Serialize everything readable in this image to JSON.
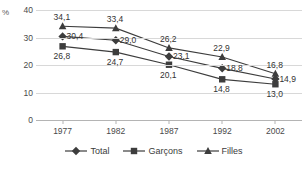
{
  "chart_data": {
    "type": "line",
    "title": "",
    "xlabel": "",
    "ylabel": "%",
    "unit_label": "%",
    "categories": [
      "1977",
      "1982",
      "1987",
      "1992",
      "2002"
    ],
    "ylim": [
      0,
      40
    ],
    "yticks": [
      "0",
      "10",
      "20",
      "30",
      "40"
    ],
    "ytick_values": [
      0,
      10,
      20,
      30,
      40
    ],
    "grid": true,
    "legend_position": "bottom-center",
    "decimal_separator": ",",
    "series": [
      {
        "name": "Total",
        "marker": "diamond",
        "color": "#3d3d3d",
        "values": [
          30.4,
          29.0,
          23.1,
          18.8,
          14.9
        ],
        "labels": [
          "30,4",
          "29,0",
          "23,1",
          "18,8",
          "14,9"
        ]
      },
      {
        "name": "Garçons",
        "marker": "square",
        "color": "#3d3d3d",
        "values": [
          26.8,
          24.7,
          20.1,
          14.8,
          13.0
        ],
        "labels": [
          "26,8",
          "24,7",
          "20,1",
          "14,8",
          "13,0"
        ]
      },
      {
        "name": "Filles",
        "marker": "triangle",
        "color": "#3d3d3d",
        "values": [
          34.1,
          33.4,
          26.2,
          22.9,
          16.8
        ],
        "labels": [
          "34,1",
          "33,4",
          "26,2",
          "22,9",
          "16,8"
        ]
      }
    ]
  },
  "legend": {
    "items": [
      {
        "label": "Total",
        "marker": "diamond"
      },
      {
        "label": "Garçons",
        "marker": "square"
      },
      {
        "label": "Filles",
        "marker": "triangle"
      }
    ]
  },
  "colors": {
    "line": "#3d3d3d",
    "grid": "#d8d8d8",
    "axis": "#b4b4b4",
    "text": "#3b3b3b",
    "background": "#ffffff"
  }
}
